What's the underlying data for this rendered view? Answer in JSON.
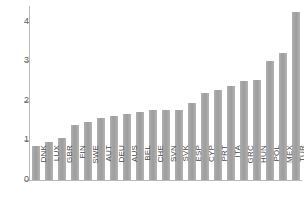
{
  "chart_data": {
    "type": "bar",
    "title": "",
    "subtitle": "",
    "xlabel": "",
    "ylabel": "",
    "ylim": [
      0,
      4.4
    ],
    "yticks": [
      0,
      1,
      2,
      3,
      4
    ],
    "ytick_labels": [
      "0",
      "1",
      "2",
      "3",
      "4"
    ],
    "grid": false,
    "legend": null,
    "bar_color": "#a8a8a8",
    "axis_color": "#b9b9b9",
    "tick_label_color": "#5d5d5d",
    "category_label_color": "#4a4a4a",
    "categories": [
      "DNK",
      "LUX",
      "GBR",
      "FIN",
      "SWE",
      "AUT",
      "DEU",
      "AUS",
      "BEL",
      "CHE",
      "SVN",
      "SVK",
      "ESP",
      "CYP",
      "PRT",
      "ITA",
      "GRC",
      "HUN",
      "POL",
      "MEX",
      "TUR"
    ],
    "values": [
      0.85,
      0.97,
      1.07,
      1.38,
      1.47,
      1.58,
      1.62,
      1.68,
      1.72,
      1.77,
      1.77,
      1.77,
      1.95,
      2.2,
      2.27,
      2.37,
      2.5,
      2.52,
      3.0,
      3.2,
      4.25
    ],
    "series": [
      {
        "name": "value",
        "values": [
          0.85,
          0.97,
          1.07,
          1.38,
          1.47,
          1.58,
          1.62,
          1.68,
          1.72,
          1.77,
          1.77,
          1.77,
          1.95,
          2.2,
          2.27,
          2.37,
          2.5,
          2.52,
          3.0,
          3.2,
          4.25
        ]
      }
    ]
  }
}
